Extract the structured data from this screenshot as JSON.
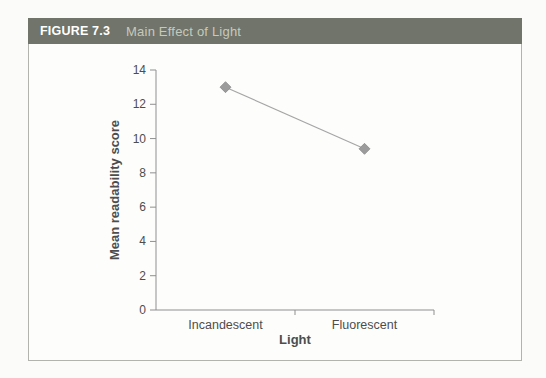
{
  "figure": {
    "label": "FIGURE 7.3",
    "title": "Main Effect of Light"
  },
  "colors": {
    "header_bg": "#70746a",
    "header_label": "#ffffff",
    "header_title": "#c7c9bb",
    "box_border": "#b2b2af",
    "axis": "#8f8f8f",
    "text": "#4d4d4d",
    "line": "#a5a5a5",
    "marker_fill": "#9b9b9b",
    "marker_edge": "#888888",
    "background": "#fbfbf9"
  },
  "chart_data": {
    "type": "line",
    "categories": [
      "Incandescent",
      "Fluorescent"
    ],
    "values": [
      13,
      9.4
    ],
    "title": "Main Effect of Light",
    "xlabel": "Light",
    "ylabel": "Mean readability score",
    "ylim": [
      0,
      14
    ],
    "yticks": [
      0,
      2,
      4,
      6,
      8,
      10,
      12,
      14
    ],
    "grid": false,
    "legend": false,
    "marker_shape": "diamond"
  }
}
